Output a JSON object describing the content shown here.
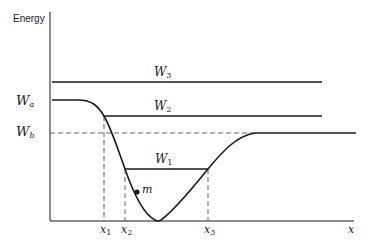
{
  "diagram": {
    "y_axis_label": "Energy",
    "x_axis_label": "x",
    "energy_levels": [
      {
        "name": "W",
        "sub": "3",
        "label": "W3"
      },
      {
        "name": "W",
        "sub": "2",
        "label": "W2"
      },
      {
        "name": "W",
        "sub": "1",
        "label": "W1"
      }
    ],
    "asymptotes": [
      {
        "name": "W",
        "sub": "a",
        "label": "Wa"
      },
      {
        "name": "W",
        "sub": "b",
        "label": "Wb"
      }
    ],
    "x_markers": [
      {
        "name": "x",
        "sub": "1",
        "label": "x1"
      },
      {
        "name": "x",
        "sub": "2",
        "label": "x2"
      },
      {
        "name": "x",
        "sub": "3",
        "label": "x3"
      }
    ],
    "particle": {
      "label": "m"
    },
    "colors": {
      "line": "#1a1a1a",
      "dashed": "#555555",
      "background": "#ffffff"
    }
  }
}
